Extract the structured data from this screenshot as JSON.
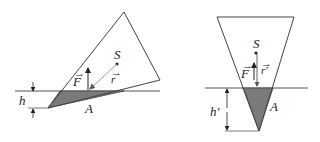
{
  "figures": [
    {
      "id": "tilted",
      "labels": {
        "center": "S",
        "force": "F",
        "radius": "r",
        "area": "A",
        "depth": "h"
      }
    },
    {
      "id": "upright",
      "labels": {
        "center": "S",
        "force": "F",
        "radius": "r'",
        "area": "A",
        "depth": "h'"
      }
    }
  ],
  "colors": {
    "outline": "#444444",
    "submerged": "#7a7a7a",
    "arrow_gray": "#9a9a9a",
    "text": "#222222"
  }
}
